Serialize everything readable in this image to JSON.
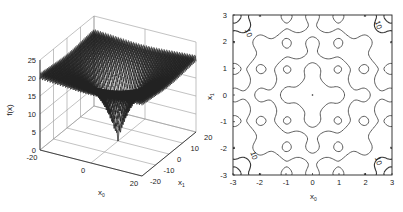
{
  "chart_data": [
    {
      "type": "surface3d",
      "title": "",
      "function": "Ackley",
      "xlabel": "x0",
      "ylabel": "x1",
      "zlabel": "f(x)",
      "x_ticks": [
        "-20",
        "0",
        "20"
      ],
      "y_ticks": [
        "-20",
        "-10",
        "0",
        "10",
        "20"
      ],
      "z_ticks": [
        "0",
        "5",
        "10",
        "15",
        "20",
        "25"
      ],
      "xlim": [
        -20,
        20
      ],
      "ylim": [
        -20,
        20
      ],
      "zlim": [
        0,
        25
      ],
      "grid": true,
      "surface": {
        "plateau_value": 21,
        "minimum": {
          "x0": 0,
          "x1": 0,
          "f": 0
        }
      }
    },
    {
      "type": "contour",
      "title": "",
      "xlabel": "x0",
      "ylabel": "x1",
      "x_ticks": [
        "-3",
        "-2",
        "-1",
        "0",
        "1",
        "2",
        "3"
      ],
      "y_ticks": [
        "-3",
        "-2",
        "-1",
        "0",
        "1",
        "2",
        "3"
      ],
      "xlim": [
        -3,
        3
      ],
      "ylim": [
        -3,
        3
      ],
      "contour_labels": [
        "10",
        "8",
        "6",
        "4"
      ],
      "grid": false
    }
  ],
  "labels": {
    "zaxis": "f(x)",
    "x0": "x",
    "x0_sub": "0",
    "x1": "x",
    "x1_sub": "1"
  }
}
